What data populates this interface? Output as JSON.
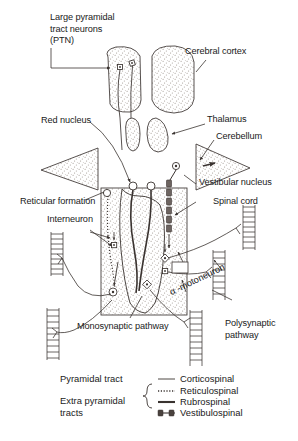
{
  "figure": {
    "background_color": "#ffffff",
    "ink_color": "#3a3330",
    "stipple_color": "#8a8078"
  },
  "labels": {
    "ptn": "Large pyramidal\ntract neurons\n(PTN)",
    "cerebral_cortex": "Cerebral cortex",
    "red_nucleus": "Red nucleus",
    "thalamus": "Thalamus",
    "cerebellum": "Cerebellum",
    "vestibular_nucleus": "Vestibular nucleus",
    "reticular_formation": "Reticular formation",
    "spinal_cord": "Spinal cord",
    "interneuron": "Interneuron",
    "alpha_motoneuron": "α -motoneuron",
    "monosynaptic_pathway": "Monosynaptic pathway",
    "polysynaptic_pathway": "Polysynaptic\npathway"
  },
  "legend": {
    "groups": [
      {
        "name": "pyramidal",
        "label": "Pyramidal tract"
      },
      {
        "name": "extrapyramidal",
        "label": "Extra pyramidal\ntracts"
      }
    ],
    "entries": [
      {
        "name": "corticospinal",
        "label": "Corticospinal",
        "style": "thin-solid"
      },
      {
        "name": "reticulospinal",
        "label": "Reticulospinal",
        "style": "dotted"
      },
      {
        "name": "rubrospinal",
        "label": "Rubrospinal",
        "style": "thick-solid"
      },
      {
        "name": "vestibulospinal",
        "label": "Vestibulospinal",
        "style": "beaded"
      }
    ]
  }
}
